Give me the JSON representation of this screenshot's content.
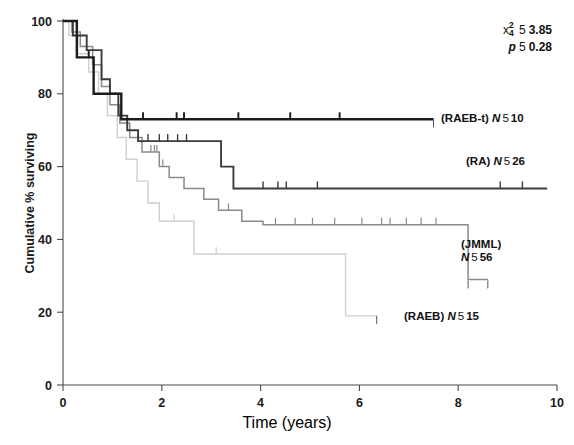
{
  "chart_data": {
    "type": "line",
    "title": "",
    "subtitle": "",
    "xlabel": "Time (years)",
    "ylabel": "Cumulative % surviving",
    "xlim": [
      0,
      10
    ],
    "ylim": [
      0,
      100
    ],
    "xticks": [
      "0",
      "2",
      "4",
      "6",
      "8",
      "10"
    ],
    "xtick_values": [
      0,
      2,
      4,
      6,
      8,
      10
    ],
    "yticks": [
      "0",
      "20",
      "40",
      "60",
      "80",
      "100"
    ],
    "ytick_values": [
      0,
      20,
      40,
      60,
      80,
      100
    ],
    "grid": false,
    "legend_position": "inline-right-of-curves",
    "annotations": {
      "chi_square": {
        "symbol": "x",
        "superscript": "2",
        "subscript": "4",
        "equals": "5",
        "value": "3.85"
      },
      "p_value": {
        "symbol": "p",
        "equals": "5",
        "value": "0.28"
      }
    },
    "series": [
      {
        "name": "RAEB-t",
        "label": "(RAEB-t)",
        "n_symbol": "N",
        "n_equals": "5",
        "n_value": "10",
        "color": "#1c1c1c",
        "stroke_width": 2.4,
        "plateau_percent": 73,
        "end_time": 7.5,
        "steps": [
          [
            0.0,
            100
          ],
          [
            0.28,
            100
          ],
          [
            0.28,
            90
          ],
          [
            0.62,
            90
          ],
          [
            0.62,
            80
          ],
          [
            1.18,
            80
          ],
          [
            1.18,
            73
          ],
          [
            7.5,
            73
          ]
        ],
        "censor_times": [
          0.52,
          1.62,
          2.3,
          2.45,
          3.55,
          4.6,
          5.6
        ]
      },
      {
        "name": "RA",
        "label": "(RA)",
        "n_symbol": "N",
        "n_equals": "5",
        "n_value": "26",
        "color": "#3b3b3b",
        "stroke_width": 1.9,
        "plateau_percent": 54,
        "end_time": 9.8,
        "steps": [
          [
            0.0,
            100
          ],
          [
            0.2,
            100
          ],
          [
            0.2,
            96
          ],
          [
            0.48,
            96
          ],
          [
            0.48,
            92
          ],
          [
            0.78,
            92
          ],
          [
            0.78,
            84
          ],
          [
            0.95,
            84
          ],
          [
            0.95,
            80
          ],
          [
            1.12,
            80
          ],
          [
            1.12,
            74
          ],
          [
            1.3,
            74
          ],
          [
            1.3,
            70
          ],
          [
            1.52,
            70
          ],
          [
            1.52,
            67
          ],
          [
            3.2,
            67
          ],
          [
            3.2,
            60
          ],
          [
            3.45,
            60
          ],
          [
            3.45,
            54
          ],
          [
            9.8,
            54
          ]
        ],
        "censor_times": [
          1.72,
          1.95,
          2.12,
          2.32,
          2.5,
          4.05,
          4.35,
          4.52,
          5.15,
          8.85,
          9.3
        ]
      },
      {
        "name": "JMML",
        "label": "(JMML)",
        "n_symbol": "N",
        "n_equals": "5",
        "n_value": "56",
        "color": "#8a8a8a",
        "stroke_width": 1.5,
        "plateau_percent": 44,
        "final_percent": 29,
        "end_time": 8.6,
        "steps": [
          [
            0.0,
            100
          ],
          [
            0.18,
            100
          ],
          [
            0.18,
            97
          ],
          [
            0.35,
            97
          ],
          [
            0.35,
            93
          ],
          [
            0.6,
            93
          ],
          [
            0.6,
            88
          ],
          [
            0.78,
            88
          ],
          [
            0.78,
            82
          ],
          [
            0.95,
            82
          ],
          [
            0.95,
            77
          ],
          [
            1.15,
            77
          ],
          [
            1.15,
            72
          ],
          [
            1.35,
            72
          ],
          [
            1.35,
            68
          ],
          [
            1.6,
            68
          ],
          [
            1.6,
            64
          ],
          [
            1.95,
            64
          ],
          [
            1.95,
            60
          ],
          [
            2.15,
            60
          ],
          [
            2.15,
            57
          ],
          [
            2.45,
            57
          ],
          [
            2.45,
            54
          ],
          [
            2.85,
            54
          ],
          [
            2.85,
            51
          ],
          [
            3.15,
            51
          ],
          [
            3.15,
            48
          ],
          [
            3.62,
            48
          ],
          [
            3.62,
            45
          ],
          [
            4.05,
            45
          ],
          [
            4.05,
            44
          ],
          [
            8.2,
            44
          ],
          [
            8.2,
            29
          ],
          [
            8.6,
            29
          ]
        ],
        "censor_times": [
          1.78,
          1.85,
          1.9,
          2.02,
          3.35,
          4.3,
          4.7,
          5.05,
          5.5,
          6.05,
          6.45,
          6.62,
          6.95,
          7.25,
          7.55
        ]
      },
      {
        "name": "RAEB",
        "label": "(RAEB)",
        "n_symbol": "N",
        "n_equals": "5",
        "n_value": "15",
        "color": "#cfcfcf",
        "stroke_width": 1.4,
        "plateau_percent": 36,
        "final_percent": 19,
        "end_time": 6.35,
        "steps": [
          [
            0.0,
            100
          ],
          [
            0.12,
            100
          ],
          [
            0.12,
            96
          ],
          [
            0.3,
            96
          ],
          [
            0.3,
            91
          ],
          [
            0.52,
            91
          ],
          [
            0.52,
            86
          ],
          [
            0.72,
            86
          ],
          [
            0.72,
            80
          ],
          [
            0.9,
            80
          ],
          [
            0.9,
            74
          ],
          [
            1.1,
            74
          ],
          [
            1.1,
            68
          ],
          [
            1.28,
            68
          ],
          [
            1.28,
            62
          ],
          [
            1.5,
            62
          ],
          [
            1.5,
            56
          ],
          [
            1.72,
            56
          ],
          [
            1.72,
            50
          ],
          [
            1.95,
            50
          ],
          [
            1.95,
            45
          ],
          [
            2.65,
            45
          ],
          [
            2.65,
            36
          ],
          [
            5.72,
            36
          ],
          [
            5.72,
            19
          ],
          [
            6.35,
            19
          ]
        ],
        "censor_times": [
          2.25,
          3.1
        ]
      }
    ]
  }
}
